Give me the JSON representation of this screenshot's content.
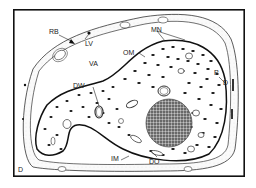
{
  "figure": {
    "type": "cell-diagram"
  },
  "labels": {
    "rb": "RB",
    "lv": "LV",
    "va": "VA",
    "dw": "DW",
    "om": "OM",
    "mn": "MN",
    "p": "P",
    "d_right": "D",
    "im": "IM",
    "do": "DO",
    "d_corner": "D"
  },
  "colors": {
    "border": "#111111",
    "line": "#333333",
    "nucleus": "#555555",
    "granule": "#111111",
    "background": "#ffffff"
  }
}
